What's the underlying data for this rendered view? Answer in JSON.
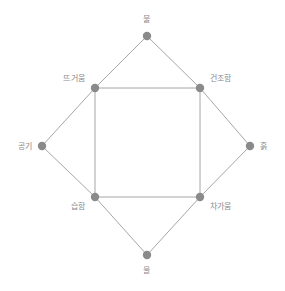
{
  "diagram": {
    "title": "",
    "colors": {
      "background": "#ffffff",
      "node": "#8a8a8a",
      "edge": "#a6a6a6",
      "label": "#8c8c8c"
    },
    "outer_shape": "diamond",
    "inner_shape": "square",
    "nodes": [
      {
        "id": "fire",
        "label": "불",
        "role": "element",
        "position": "top",
        "x": 147,
        "y": 36,
        "label_x": 147,
        "label_y": 20,
        "label_align": "center"
      },
      {
        "id": "air",
        "label": "공기",
        "role": "element",
        "position": "left",
        "x": 42,
        "y": 146,
        "label_x": 32,
        "label_y": 147,
        "label_align": "left-of"
      },
      {
        "id": "earth",
        "label": "흙",
        "role": "element",
        "position": "right",
        "x": 250,
        "y": 146,
        "label_x": 260,
        "label_y": 147,
        "label_align": "right-of"
      },
      {
        "id": "water",
        "label": "물",
        "role": "element",
        "position": "bottom",
        "x": 147,
        "y": 255,
        "label_x": 147,
        "label_y": 271,
        "label_align": "center"
      },
      {
        "id": "hot",
        "label": "뜨거움",
        "role": "quality",
        "position": "top-left",
        "x": 95,
        "y": 88,
        "label_x": 85,
        "label_y": 79,
        "label_align": "left-of"
      },
      {
        "id": "dry",
        "label": "건조함",
        "role": "quality",
        "position": "top-right",
        "x": 200,
        "y": 88,
        "label_x": 210,
        "label_y": 79,
        "label_align": "right-of"
      },
      {
        "id": "wet",
        "label": "습함",
        "role": "quality",
        "position": "bottom-left",
        "x": 95,
        "y": 197,
        "label_x": 85,
        "label_y": 207,
        "label_align": "left-of"
      },
      {
        "id": "cold",
        "label": "차가움",
        "role": "quality",
        "position": "bottom-right",
        "x": 200,
        "y": 197,
        "label_x": 210,
        "label_y": 207,
        "label_align": "right-of"
      }
    ],
    "edges": [
      {
        "from": "fire",
        "to": "hot",
        "shape": "diamond-side"
      },
      {
        "from": "hot",
        "to": "air",
        "shape": "diamond-side"
      },
      {
        "from": "air",
        "to": "wet",
        "shape": "diamond-side"
      },
      {
        "from": "wet",
        "to": "water",
        "shape": "diamond-side"
      },
      {
        "from": "water",
        "to": "cold",
        "shape": "diamond-side"
      },
      {
        "from": "cold",
        "to": "earth",
        "shape": "diamond-side"
      },
      {
        "from": "earth",
        "to": "dry",
        "shape": "diamond-side"
      },
      {
        "from": "dry",
        "to": "fire",
        "shape": "diamond-side"
      },
      {
        "from": "hot",
        "to": "dry",
        "shape": "square-side"
      },
      {
        "from": "dry",
        "to": "cold",
        "shape": "square-side"
      },
      {
        "from": "cold",
        "to": "wet",
        "shape": "square-side"
      },
      {
        "from": "wet",
        "to": "hot",
        "shape": "square-side"
      }
    ]
  }
}
